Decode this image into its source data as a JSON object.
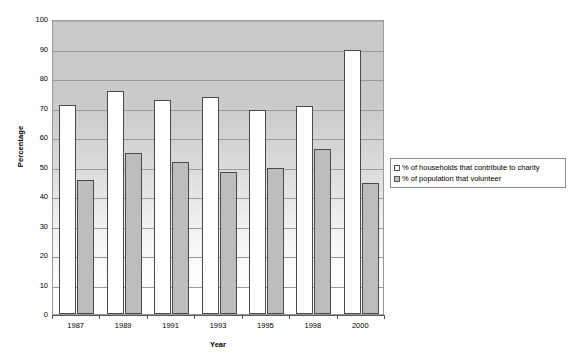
{
  "chart_data": {
    "type": "bar",
    "title": "",
    "xlabel": "Year",
    "ylabel": "Percentage",
    "categories": [
      "1987",
      "1989",
      "1991",
      "1993",
      "1995",
      "1998",
      "2000"
    ],
    "series": [
      {
        "name": "% of households that contribute to charity",
        "color": "#ffffff",
        "values": [
          71.0,
          75.5,
          72.5,
          73.7,
          69.0,
          70.5,
          89.5
        ]
      },
      {
        "name": "% of population that volunteer",
        "color": "#bdbdbd",
        "values": [
          45.5,
          54.5,
          51.5,
          48.0,
          49.5,
          56.0,
          44.5
        ]
      }
    ],
    "ylim": [
      0,
      100
    ],
    "yticks": [
      0,
      10,
      20,
      30,
      40,
      50,
      60,
      70,
      80,
      90,
      100
    ],
    "ytick_labels": [
      "0",
      "10",
      "20",
      "30",
      "40",
      "50",
      "60",
      "70",
      "80",
      "90",
      "100"
    ],
    "grid": true,
    "legend_position": "right"
  },
  "legend": {
    "entries": [
      {
        "label": "% of households that contribute to charity",
        "swatch": "series-a"
      },
      {
        "label": "% of population that volunteer",
        "swatch": "series-b"
      }
    ]
  },
  "axes": {
    "y_title": "Percentage",
    "x_title": "Year"
  }
}
